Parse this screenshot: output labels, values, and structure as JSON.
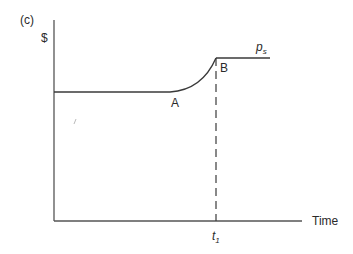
{
  "panel_label": "(c)",
  "y_axis_label": "$",
  "x_axis_label": "Time",
  "points": {
    "a": "A",
    "b": "B"
  },
  "curve_label": {
    "base": "p",
    "sub": "s"
  },
  "tick_label": {
    "base": "t",
    "sub": "1"
  },
  "colors": {
    "line": "#3a3a3a",
    "background": "#ffffff"
  }
}
